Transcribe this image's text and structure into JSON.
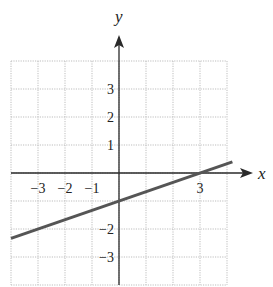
{
  "chart_data": {
    "type": "line",
    "title": "",
    "xlabel": "x",
    "ylabel": "y",
    "xlim": [
      -4,
      4
    ],
    "ylim": [
      -4,
      4
    ],
    "grid": true,
    "grid_style": "dotted",
    "x_tick_labels": [
      {
        "value": -3,
        "label": "−3"
      },
      {
        "value": -2,
        "label": "−2"
      },
      {
        "value": -1,
        "label": "−1"
      },
      {
        "value": 3,
        "label": "3"
      }
    ],
    "y_tick_labels": [
      {
        "value": 3,
        "label": "3"
      },
      {
        "value": 2,
        "label": "2"
      },
      {
        "value": 1,
        "label": "1"
      },
      {
        "value": -2,
        "label": "−2"
      },
      {
        "value": -3,
        "label": "−3"
      }
    ],
    "series": [
      {
        "name": "y = (1/3)x − 1",
        "equation": "y = x/3 - 1",
        "slope": 0.3333,
        "intercept": -1,
        "x": [
          -4,
          -3,
          0,
          3,
          4.2
        ],
        "values": [
          -2.33,
          -2,
          -1,
          0,
          0.4
        ],
        "color": "#555555"
      }
    ]
  },
  "colors": {
    "grid": "#bdbdbd",
    "axis": "#2a2a2a",
    "line": "#555555"
  }
}
